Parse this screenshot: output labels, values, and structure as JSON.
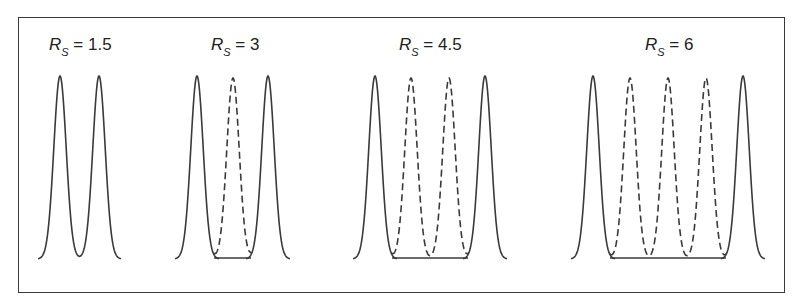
{
  "figure": {
    "panels": [
      {
        "label_symbol": "R",
        "label_subscript": "S",
        "label_value": "= 1.5",
        "resolution": 1.5,
        "solid_peaks": 2,
        "dashed_peaks": 0
      },
      {
        "label_symbol": "R",
        "label_subscript": "S",
        "label_value": "= 3",
        "resolution": 3,
        "solid_peaks": 2,
        "dashed_peaks": 1
      },
      {
        "label_symbol": "R",
        "label_subscript": "S",
        "label_value": "= 4.5",
        "resolution": 4.5,
        "solid_peaks": 2,
        "dashed_peaks": 2
      },
      {
        "label_symbol": "R",
        "label_subscript": "S",
        "label_value": "= 6",
        "resolution": 6,
        "solid_peaks": 2,
        "dashed_peaks": 3
      }
    ]
  },
  "colors": {
    "line": "#3a3a3a",
    "background": "#ffffff"
  }
}
